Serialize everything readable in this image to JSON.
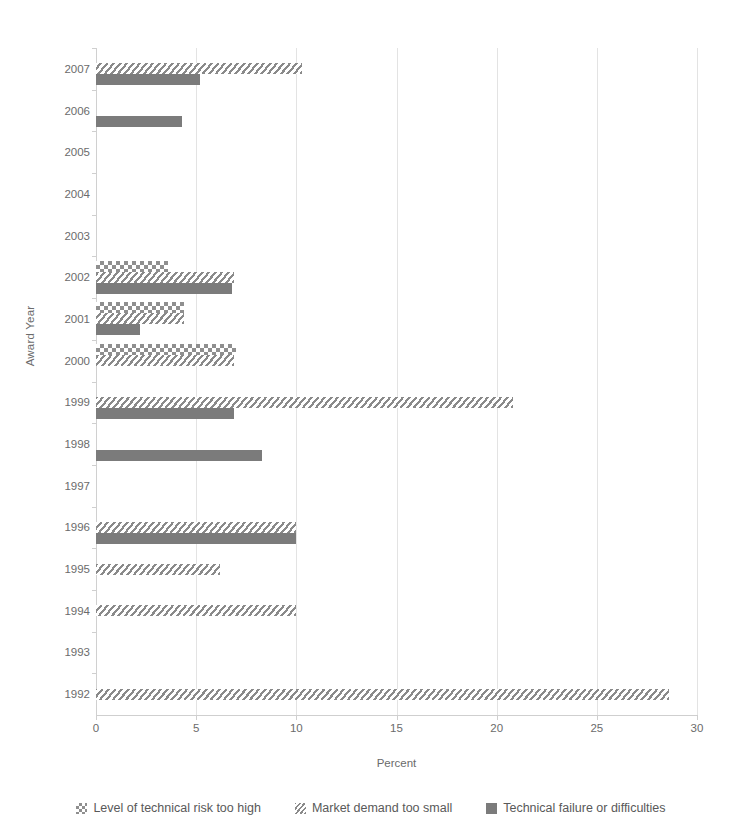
{
  "chart_data": {
    "type": "bar",
    "orientation": "horizontal",
    "title": "",
    "xlabel": "Percent",
    "ylabel": "Award Year",
    "xlim": [
      0,
      30
    ],
    "xticks": [
      0,
      5,
      10,
      15,
      20,
      25,
      30
    ],
    "xtick_labels": [
      "0",
      "5",
      "10",
      "15",
      "20",
      "25",
      "30"
    ],
    "grid": true,
    "grid_axis": "x",
    "legend_position": "bottom",
    "categories": [
      "2007",
      "2006",
      "2005",
      "2004",
      "2003",
      "2002",
      "2001",
      "2000",
      "1999",
      "1998",
      "1997",
      "1996",
      "1995",
      "1994",
      "1993",
      "1992"
    ],
    "series": [
      {
        "name": "Level of technical risk too high",
        "pattern": "checkered",
        "color": "#8f8f8f",
        "values": [
          0,
          0,
          0,
          0,
          0,
          3.6,
          4.4,
          7.0,
          0,
          0,
          0,
          0,
          0,
          0,
          0,
          0
        ]
      },
      {
        "name": "Market demand too small",
        "pattern": "diagonal-hatch",
        "color": "#8a8a8a",
        "values": [
          10.3,
          0,
          0,
          0,
          0,
          6.9,
          4.4,
          6.9,
          20.8,
          0,
          0,
          10.0,
          6.2,
          10.0,
          0,
          28.6
        ]
      },
      {
        "name": "Technical failure or difficulties",
        "pattern": "solid",
        "color": "#7b7b7b",
        "values": [
          5.2,
          4.3,
          0,
          0,
          0,
          6.8,
          2.2,
          0,
          6.9,
          8.3,
          0,
          10.0,
          0,
          0,
          0,
          0
        ]
      }
    ]
  },
  "axis": {
    "x_title": "Percent",
    "y_title": "Award Year"
  }
}
